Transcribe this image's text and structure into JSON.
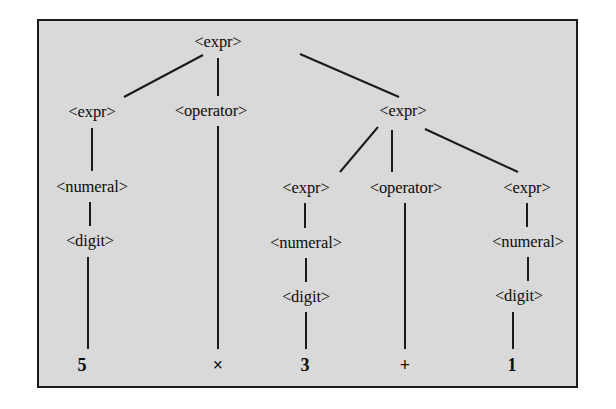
{
  "figure": {
    "kind": "parse-tree-diagram",
    "caption": "",
    "background_color": "#d9d9d9",
    "border_color": "#1a1a1a",
    "text_color": "#0d0d0d",
    "expression": "5 × 3 + 1"
  },
  "nodes": {
    "root_expr": "<expr>",
    "left_expr": "<expr>",
    "left_numeral": "<numeral>",
    "left_digit": "<digit>",
    "top_operator": "<operator>",
    "right_expr": "<expr>",
    "right_left_expr": "<expr>",
    "right_left_numeral": "<numeral>",
    "right_left_digit": "<digit>",
    "right_operator": "<operator>",
    "right_right_expr": "<expr>",
    "right_right_numeral": "<numeral>",
    "right_right_digit": "<digit>"
  },
  "terminals": {
    "five": "5",
    "times": "×",
    "three": "3",
    "plus": "+",
    "one": "1"
  }
}
